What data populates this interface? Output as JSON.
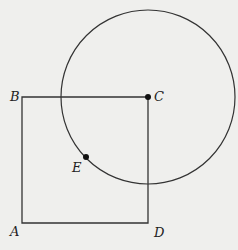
{
  "diagram": {
    "background": "#efefed",
    "stroke": "#333333",
    "square": {
      "vertices": {
        "A": [
          22,
          223
        ],
        "B": [
          22,
          97
        ],
        "C": [
          148,
          97
        ],
        "D": [
          148,
          223
        ]
      }
    },
    "circle": {
      "center_label": "C",
      "cx": 148,
      "cy": 97,
      "r": 87
    },
    "points": [
      {
        "name": "C",
        "x": 148,
        "y": 97,
        "dot": true
      },
      {
        "name": "E",
        "x": 86,
        "y": 157,
        "dot": true
      }
    ],
    "labels": [
      {
        "id": "A",
        "text": "A",
        "x": 10,
        "y": 235
      },
      {
        "id": "B",
        "text": "B",
        "x": 10,
        "y": 97
      },
      {
        "id": "C",
        "text": "C",
        "x": 154,
        "y": 97
      },
      {
        "id": "D",
        "text": "D",
        "x": 154,
        "y": 239
      },
      {
        "id": "E",
        "text": "E",
        "x": 72,
        "y": 172
      }
    ]
  }
}
